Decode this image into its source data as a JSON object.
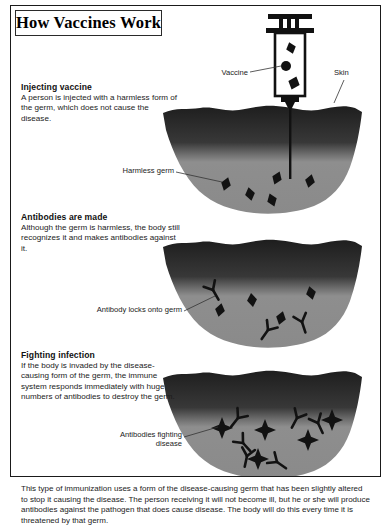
{
  "title": "How Vaccines Work",
  "steps": [
    {
      "heading": "Injecting vaccine",
      "body": "A person is injected with a harmless form of the germ, which does not cause the disease."
    },
    {
      "heading": "Antibodies are made",
      "body": "Although the germ is harmless, the body still recognizes it and makes antibodies against it."
    },
    {
      "heading": "Fighting infection",
      "body": "If the body is invaded by the disease-causing form of the germ, the immune system responds immediately with huge numbers of antibodies to destroy the germ."
    }
  ],
  "callouts": {
    "vaccine": "Vaccine",
    "skin": "Skin",
    "harmless_germ": "Harmless germ",
    "antibody_locks": "Antibody locks onto germ",
    "antibodies_fighting": "Antibodies fighting disease"
  },
  "footer": "This type of immunization uses a form of the disease-causing germ that has been slightly altered to stop it causing the disease. The person receiving it will not become ill, but he or she will produce antibodies against the pathogen that does cause disease. The body will do this every time it is threatened by that germ.",
  "colors": {
    "skin_dark": "#2b2b2b",
    "tissue_gray": "#8c8c8c",
    "germ_black": "#111111",
    "frame": "#1a1a1a",
    "background": "#ffffff"
  },
  "diagram": {
    "syringe": {
      "label": "syringe",
      "contents": [
        "germ-diamond",
        "germ-dot",
        "germ-diamond"
      ]
    },
    "panels": [
      {
        "name": "panel-injection",
        "germ_shape": "diamond",
        "germ_count": 5,
        "antibody_count": 0
      },
      {
        "name": "panel-antibodies",
        "germ_shape": "diamond",
        "germ_count": 5,
        "antibody_count": 3
      },
      {
        "name": "panel-fighting",
        "germ_shape": "star",
        "germ_count": 5,
        "antibody_count": 6
      }
    ]
  }
}
